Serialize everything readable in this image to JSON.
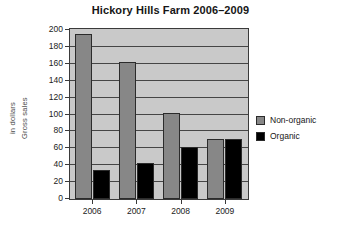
{
  "chart_data": {
    "type": "bar",
    "title": "Hickory Hills Farm 2006–2009",
    "xlabel": "",
    "ylabel_line1": "Gross sales",
    "ylabel_line2": "in dollars",
    "categories": [
      "2006",
      "2007",
      "2008",
      "2009"
    ],
    "series": [
      {
        "name": "Non-organic",
        "color": "#878787",
        "values": [
          195,
          162,
          102,
          71
        ]
      },
      {
        "name": "Organic",
        "color": "#000000",
        "values": [
          34,
          43,
          62,
          71
        ]
      }
    ],
    "ylim": [
      0,
      200
    ],
    "ytick_step": 20,
    "yticks": [
      0,
      20,
      40,
      60,
      80,
      100,
      120,
      140,
      160,
      180,
      200
    ],
    "ytick_labels": [
      "0",
      "20",
      "40",
      "60",
      "80",
      "100",
      "120",
      "140",
      "160",
      "180",
      "200"
    ],
    "grid": true,
    "grid_axis": "y",
    "legend_position": "right",
    "plot_background": "#c9c9c9",
    "figure_background": "#ffffff",
    "axis_color": "#3a3a3a"
  },
  "legend": {
    "entries": [
      {
        "label": "Non-organic",
        "swatch": "nonorganic"
      },
      {
        "label": "Organic",
        "swatch": "organic"
      }
    ]
  }
}
